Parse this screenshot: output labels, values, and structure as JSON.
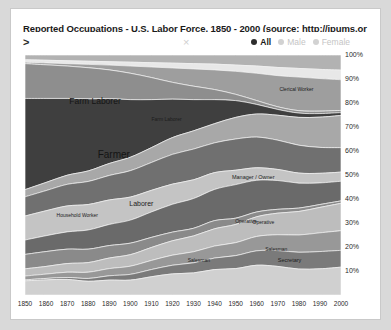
{
  "window": {
    "title": "Reported Occupations - U.S. Labor Force, 1850 - 2000 (source: http://ipums.or"
  },
  "toolbar": {
    "expand_caret": ">",
    "close_mark": "×",
    "options": [
      {
        "label": "All",
        "selected": true
      },
      {
        "label": "Male",
        "selected": false
      },
      {
        "label": "Female",
        "selected": false
      }
    ]
  },
  "chart_data": {
    "type": "area",
    "title": "Reported Occupations - U.S. Labor Force, 1850 - 2000 (source: http://ipums.or",
    "xlabel": "",
    "ylabel": "",
    "grid": false,
    "legend_position": "top-right",
    "xlim": [
      1850,
      2000
    ],
    "ylim": [
      0,
      100
    ],
    "x": [
      1850,
      1860,
      1870,
      1880,
      1890,
      1900,
      1910,
      1920,
      1930,
      1940,
      1950,
      1960,
      1970,
      1980,
      1990,
      2000
    ],
    "xtick_labels": [
      "1850",
      "1860",
      "1870",
      "1880",
      "1890",
      "1900",
      "1910",
      "1920",
      "1930",
      "1940",
      "1950",
      "1960",
      "1970",
      "1980",
      "1990",
      "2000"
    ],
    "ytick_labels": [
      "100%",
      "90%",
      "80%",
      "70%",
      "60%",
      "50%",
      "40%",
      "30%",
      "20%",
      "10%"
    ],
    "ytick_values": [
      100,
      90,
      80,
      70,
      60,
      50,
      40,
      30,
      20,
      10
    ],
    "stacked": true,
    "normalized_percent": true,
    "annotations": [
      {
        "text": "Farm Laborer",
        "x_pct": 14.0,
        "y_pct": 17.0,
        "size": 8.5
      },
      {
        "text": "Farm Laborer",
        "x_pct": 40.0,
        "y_pct": 25.5,
        "size": 5.0
      },
      {
        "text": "Farmer",
        "x_pct": 23.0,
        "y_pct": 39.0,
        "size": 10.0
      },
      {
        "text": "Clerical Worker",
        "x_pct": 80.5,
        "y_pct": 13.0,
        "size": 5.0
      },
      {
        "text": "Manager / Owner",
        "x_pct": 65.5,
        "y_pct": 49.5,
        "size": 5.5
      },
      {
        "text": "Laborer",
        "x_pct": 33.0,
        "y_pct": 60.5,
        "size": 7.0
      },
      {
        "text": "Household Worker",
        "x_pct": 10.0,
        "y_pct": 65.5,
        "size": 5.0
      },
      {
        "text": "Operative",
        "x_pct": 66.5,
        "y_pct": 68.0,
        "size": 5.0
      },
      {
        "text": "Operative",
        "x_pct": 72.0,
        "y_pct": 68.5,
        "size": 5.0
      },
      {
        "text": "Salesman",
        "x_pct": 51.5,
        "y_pct": 84.0,
        "size": 5.0
      },
      {
        "text": "Salesman",
        "x_pct": 76.0,
        "y_pct": 79.5,
        "size": 5.0
      },
      {
        "text": "Secretary",
        "x_pct": 80.0,
        "y_pct": 84.0,
        "size": 5.5
      }
    ],
    "series": [
      {
        "name": "Other Professional",
        "color": "#b2b2b2",
        "values": [
          2.0,
          2.2,
          2.4,
          2.6,
          2.8,
          3.0,
          3.2,
          3.4,
          3.6,
          3.8,
          4.2,
          4.6,
          5.2,
          5.6,
          6.0,
          6.3
        ]
      },
      {
        "name": "Teacher",
        "color": "#e8e8e8",
        "values": [
          1.0,
          1.1,
          1.2,
          1.3,
          1.4,
          1.6,
          1.8,
          2.0,
          2.2,
          2.4,
          2.6,
          3.0,
          3.4,
          3.6,
          3.8,
          4.0
        ]
      },
      {
        "name": "Clerical Worker",
        "color": "#9e9e9e",
        "values": [
          0.6,
          0.8,
          1.0,
          1.4,
          2.0,
          3.0,
          4.4,
          6.0,
          7.2,
          8.2,
          9.6,
          11.4,
          13.0,
          14.0,
          13.6,
          12.8
        ]
      },
      {
        "name": "Farm Laborer",
        "color": "#8e8e8e",
        "values": [
          14.5,
          14.0,
          13.5,
          13.0,
          12.0,
          11.0,
          9.2,
          7.0,
          5.6,
          4.2,
          2.6,
          1.6,
          1.1,
          1.0,
          1.0,
          0.9
        ]
      },
      {
        "name": "Farmer",
        "color": "#3f3f3f",
        "values": [
          38.0,
          35.0,
          32.0,
          30.0,
          27.0,
          24.0,
          20.0,
          16.0,
          13.0,
          10.0,
          7.0,
          4.0,
          2.4,
          1.8,
          1.5,
          1.2
        ]
      },
      {
        "name": "Manager / Owner",
        "color": "#a8a8a8",
        "values": [
          3.0,
          3.4,
          3.8,
          4.4,
          5.0,
          5.6,
          6.2,
          7.0,
          7.6,
          8.0,
          9.0,
          9.6,
          10.4,
          11.6,
          12.6,
          13.4
        ]
      },
      {
        "name": "Craftsman",
        "color": "#707070",
        "values": [
          8.0,
          8.4,
          9.0,
          9.6,
          10.2,
          11.0,
          11.6,
          12.4,
          12.8,
          12.4,
          13.0,
          12.8,
          12.2,
          11.6,
          10.8,
          10.2
        ]
      },
      {
        "name": "Laborer",
        "color": "#c4c4c4",
        "values": [
          10.0,
          10.4,
          10.8,
          10.6,
          10.2,
          9.6,
          9.0,
          8.4,
          7.8,
          7.0,
          6.0,
          5.2,
          4.6,
          4.2,
          4.0,
          3.8
        ]
      },
      {
        "name": "Operative",
        "color": "#6a6a6a",
        "values": [
          6.0,
          6.6,
          7.2,
          8.0,
          8.8,
          9.6,
          10.6,
          11.6,
          12.4,
          13.0,
          14.0,
          13.2,
          12.0,
          10.4,
          9.0,
          8.2
        ]
      },
      {
        "name": "Household Worker",
        "color": "#8a8a8a",
        "values": [
          6.0,
          6.2,
          6.0,
          5.6,
          5.2,
          4.8,
          4.2,
          3.6,
          3.2,
          3.4,
          2.6,
          2.0,
          1.6,
          1.4,
          1.2,
          1.0
        ]
      },
      {
        "name": "Service Worker",
        "color": "#bdbdbd",
        "values": [
          3.0,
          3.2,
          3.6,
          4.0,
          4.4,
          4.8,
          5.4,
          6.0,
          6.6,
          7.2,
          7.6,
          8.2,
          9.0,
          9.8,
          10.6,
          11.4
        ]
      },
      {
        "name": "Salesman",
        "color": "#989898",
        "values": [
          1.6,
          1.8,
          2.2,
          2.6,
          3.0,
          3.4,
          3.8,
          4.2,
          4.6,
          5.0,
          5.4,
          6.0,
          6.6,
          7.2,
          7.8,
          8.2
        ]
      },
      {
        "name": "Secretary",
        "color": "#7a7a7a",
        "values": [
          0.4,
          0.6,
          0.8,
          1.2,
          1.8,
          2.4,
          3.0,
          3.6,
          4.2,
          4.8,
          5.4,
          6.0,
          6.6,
          7.0,
          7.2,
          7.0
        ]
      },
      {
        "name": "Other",
        "color": "#d0d0d0",
        "values": [
          5.9,
          6.3,
          6.5,
          5.7,
          6.2,
          6.2,
          7.6,
          8.8,
          9.2,
          10.6,
          11.0,
          12.4,
          11.9,
          10.8,
          10.9,
          11.6
        ]
      }
    ]
  }
}
